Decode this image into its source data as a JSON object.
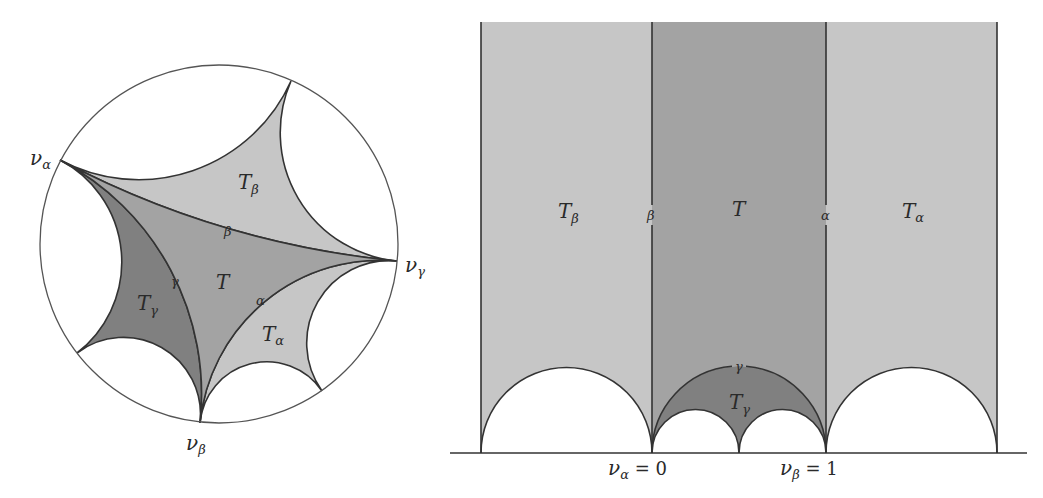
{
  "colors": {
    "light": "#c6c6c6",
    "mid": "#a3a3a3",
    "dark": "#808080",
    "stroke": "#333333",
    "circle": "#555555"
  },
  "disk": {
    "vertices": {
      "v_alpha": {
        "label": "ν",
        "sub": "α"
      },
      "v_beta": {
        "label": "ν",
        "sub": "β"
      },
      "v_gamma": {
        "label": "ν",
        "sub": "γ"
      }
    },
    "regions": {
      "T": "T",
      "T_alpha": {
        "main": "T",
        "sub": "α"
      },
      "T_beta": {
        "main": "T",
        "sub": "β"
      },
      "T_gamma": {
        "main": "T",
        "sub": "γ"
      }
    },
    "edges": {
      "alpha": "α",
      "beta": "β",
      "gamma": "γ"
    }
  },
  "halfplane": {
    "regions": {
      "T": "T",
      "T_alpha": {
        "main": "T",
        "sub": "α"
      },
      "T_beta": {
        "main": "T",
        "sub": "β"
      },
      "T_gamma": {
        "main": "T",
        "sub": "γ"
      }
    },
    "edges": {
      "alpha": "α",
      "beta": "β",
      "gamma": "γ"
    },
    "axis_labels": {
      "v_alpha": {
        "main": "ν",
        "sub": "α",
        "eq": " = 0"
      },
      "v_beta": {
        "main": "ν",
        "sub": "β",
        "eq": " = 1"
      }
    }
  }
}
